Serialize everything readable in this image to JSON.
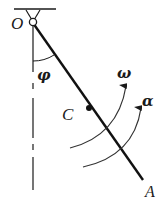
{
  "diagram": {
    "type": "pendulum-rod-kinematics",
    "labels": {
      "pivot": "O",
      "angle": "φ",
      "center": "C",
      "end": "A",
      "angular_velocity": "ω",
      "angular_acceleration": "α"
    },
    "colors": {
      "stroke": "#1a1a1a",
      "arc": "#333333",
      "background": "#ffffff"
    }
  }
}
